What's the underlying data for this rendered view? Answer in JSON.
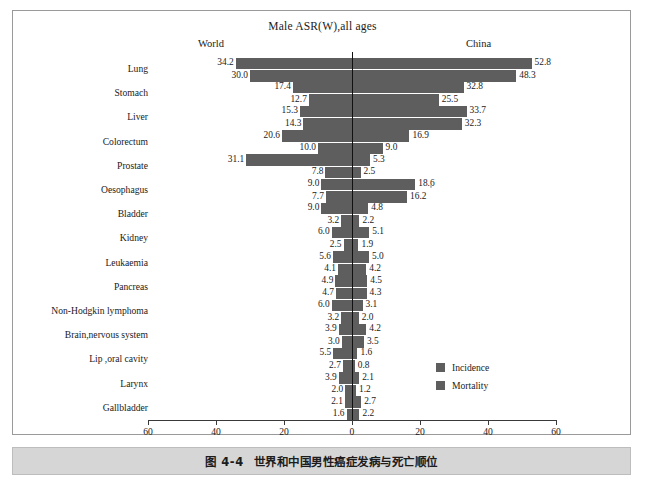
{
  "figure": {
    "chart_title": "Male ASR(W),all ages",
    "left_header": "World",
    "right_header": "China",
    "caption_number": "图 4-4",
    "caption_text": "世界和中国男性癌症发病与死亡顺位",
    "bar_color": "#5e5e5e",
    "axis_color": "#3a3a3a"
  },
  "legend": {
    "position": "center-right",
    "items": [
      {
        "label": "Incidence",
        "color": "#5e5e5e"
      },
      {
        "label": "Mortality",
        "color": "#5e5e5e"
      }
    ]
  },
  "axis": {
    "ticks": [
      "60",
      "40",
      "20",
      "0",
      "20",
      "40",
      "60"
    ],
    "tick_values": [
      -60,
      -40,
      -20,
      0,
      20,
      40,
      60
    ],
    "min": -60,
    "max": 60
  },
  "chart_data": {
    "type": "bar",
    "orientation": "horizontal-diverging",
    "title": "Male ASR(W),all ages",
    "xlabel": "",
    "ylabel": "",
    "xlim": [
      -60,
      60
    ],
    "grid": false,
    "legend_position": "center-right",
    "panels": [
      "World",
      "China"
    ],
    "categories": [
      "Lung",
      "Stomach",
      "Liver",
      "Colorectum",
      "Prostate",
      "Oesophagus",
      "Bladder",
      "Kidney",
      "Leukaemia",
      "Pancreas",
      "Non-Hodgkin lymphoma",
      "Brain,nervous system",
      "Lip ,oral cavity",
      "Larynx",
      "Gallbladder"
    ],
    "series": [
      {
        "name": "World Incidence",
        "panel": "World",
        "metric": "Incidence",
        "values": [
          34.2,
          17.4,
          15.3,
          20.6,
          31.1,
          9.0,
          9.0,
          6.0,
          5.6,
          4.9,
          6.0,
          3.9,
          5.5,
          3.9,
          2.1
        ]
      },
      {
        "name": "World Mortality",
        "panel": "World",
        "metric": "Mortality",
        "values": [
          30.0,
          12.7,
          14.3,
          10.0,
          7.8,
          7.7,
          3.2,
          2.5,
          4.1,
          4.7,
          3.2,
          3.0,
          2.7,
          2.0,
          1.6
        ]
      },
      {
        "name": "China Incidence",
        "panel": "China",
        "metric": "Incidence",
        "values": [
          52.8,
          32.8,
          33.7,
          16.9,
          5.3,
          18.6,
          4.8,
          5.1,
          5.0,
          4.5,
          3.1,
          4.2,
          1.6,
          2.1,
          2.7
        ]
      },
      {
        "name": "China Mortality",
        "panel": "China",
        "metric": "Mortality",
        "values": [
          48.3,
          25.5,
          32.3,
          9.0,
          2.5,
          16.2,
          2.2,
          1.9,
          4.2,
          4.3,
          2.0,
          3.5,
          0.8,
          1.2,
          2.2
        ]
      }
    ],
    "rows": [
      {
        "category": "Lung",
        "world_incidence": "34.2",
        "world_mortality": "30.0",
        "china_incidence": "52.8",
        "china_mortality": "48.3"
      },
      {
        "category": "Stomach",
        "world_incidence": "17.4",
        "world_mortality": "12.7",
        "china_incidence": "32.8",
        "china_mortality": "25.5"
      },
      {
        "category": "Liver",
        "world_incidence": "15.3",
        "world_mortality": "14.3",
        "china_incidence": "33.7",
        "china_mortality": "32.3"
      },
      {
        "category": "Colorectum",
        "world_incidence": "20.6",
        "world_mortality": "10.0",
        "china_incidence": "16.9",
        "china_mortality": "9.0"
      },
      {
        "category": "Prostate",
        "world_incidence": "31.1",
        "world_mortality": "7.8",
        "china_incidence": "5.3",
        "china_mortality": "2.5"
      },
      {
        "category": "Oesophagus",
        "world_incidence": "9.0",
        "world_mortality": "7.7",
        "china_incidence": "18.6",
        "china_mortality": "16.2"
      },
      {
        "category": "Bladder",
        "world_incidence": "9.0",
        "world_mortality": "3.2",
        "china_incidence": "4.8",
        "china_mortality": "2.2"
      },
      {
        "category": "Kidney",
        "world_incidence": "6.0",
        "world_mortality": "2.5",
        "china_incidence": "5.1",
        "china_mortality": "1.9"
      },
      {
        "category": "Leukaemia",
        "world_incidence": "5.6",
        "world_mortality": "4.1",
        "china_incidence": "5.0",
        "china_mortality": "4.2"
      },
      {
        "category": "Pancreas",
        "world_incidence": "4.9",
        "world_mortality": "4.7",
        "china_incidence": "4.5",
        "china_mortality": "4.3"
      },
      {
        "category": "Non-Hodgkin lymphoma",
        "world_incidence": "6.0",
        "world_mortality": "3.2",
        "china_incidence": "3.1",
        "china_mortality": "2.0"
      },
      {
        "category": "Brain,nervous system",
        "world_incidence": "3.9",
        "world_mortality": "3.0",
        "china_incidence": "4.2",
        "china_mortality": "3.5"
      },
      {
        "category": "Lip ,oral cavity",
        "world_incidence": "5.5",
        "world_mortality": "2.7",
        "china_incidence": "1.6",
        "china_mortality": "0.8"
      },
      {
        "category": "Larynx",
        "world_incidence": "3.9",
        "world_mortality": "2.0",
        "china_incidence": "2.1",
        "china_mortality": "1.2"
      },
      {
        "category": "Gallbladder",
        "world_incidence": "2.1",
        "world_mortality": "1.6",
        "china_incidence": "2.7",
        "china_mortality": "2.2"
      }
    ]
  }
}
